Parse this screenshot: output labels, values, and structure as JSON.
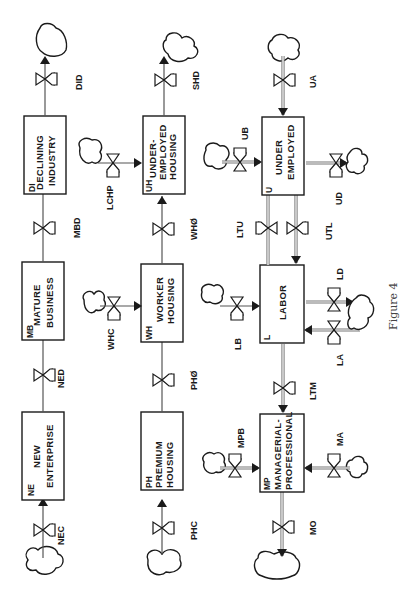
{
  "figure_caption": "Figure 4",
  "orientation": "rotated-90-counterclockwise",
  "levels": {
    "NE": {
      "abbr": "NE",
      "line1": "NEW",
      "line2": "ENTERPRISE",
      "line3": ""
    },
    "MB": {
      "abbr": "MB",
      "line1": "MATURE",
      "line2": "BUSINESS",
      "line3": ""
    },
    "DI": {
      "abbr": "DI",
      "line1": "DECLINING",
      "line2": "INDUSTRY",
      "line3": ""
    },
    "PH": {
      "abbr": "PH",
      "line1": "PREMIUM",
      "line2": "HOUSING",
      "line3": ""
    },
    "WH": {
      "abbr": "WH",
      "line1": "WORKER",
      "line2": "HOUSING",
      "line3": ""
    },
    "UH": {
      "abbr": "UH",
      "line1": "UNDER-",
      "line2": "EMPLOYED",
      "line3": "HOUSING"
    },
    "MP": {
      "abbr": "MP",
      "line1": "MANAGERIAL-",
      "line2": "PROFESSIONAL",
      "line3": ""
    },
    "L": {
      "abbr": "L",
      "line1": "LABOR",
      "line2": "",
      "line3": ""
    },
    "U": {
      "abbr": "U",
      "line1": "UNDER",
      "line2": "EMPLOYED",
      "line3": ""
    }
  },
  "rates": {
    "NEC": "NEC",
    "NED": "NED",
    "MBD": "MBD",
    "DID": "DID",
    "PHC": "PHC",
    "PHO": "PHØ",
    "WHC": "WHC",
    "WHO": "WHØ",
    "LCHP": "LCHP",
    "SHD": "SHD",
    "MPB": "MPB",
    "MA": "MA",
    "MO": "MO",
    "LTM": "LTM",
    "LB": "LB",
    "LA": "LA",
    "LD": "LD",
    "LTU": "LTU",
    "UTL": "UTL",
    "UB": "UB",
    "UA": "UA",
    "UD": "UD"
  }
}
